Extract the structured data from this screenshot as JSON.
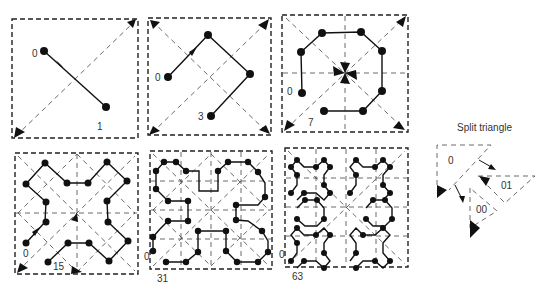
{
  "diagram": {
    "type": "hilbert-like space-filling curve via split triangles",
    "panels": [
      {
        "id": "level-1",
        "start_label": "0",
        "end_label": "1",
        "points": 2
      },
      {
        "id": "level-2",
        "start_label": "0",
        "end_label": "3",
        "points": 4
      },
      {
        "id": "level-3",
        "start_label": "0",
        "end_label": "7",
        "points": 8
      },
      {
        "id": "level-4",
        "start_label": "0",
        "end_label": "15",
        "points": 16
      },
      {
        "id": "level-5",
        "start_label": "0",
        "end_label": "31",
        "points": 32
      },
      {
        "id": "level-6",
        "start_label": "0",
        "end_label": "63",
        "points": 64
      }
    ],
    "legend": {
      "title": "Split triangle",
      "labels": [
        "0",
        "01",
        "00"
      ]
    }
  }
}
